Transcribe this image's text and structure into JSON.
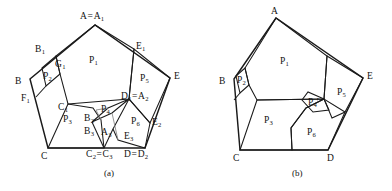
{
  "figure": {
    "panels": [
      {
        "id": "a",
        "caption": "(a)",
        "caption_pos": [
          104,
          168
        ],
        "outer_pentagon": [
          [
            95,
            25
          ],
          [
            30,
            79
          ],
          [
            48,
            148
          ],
          [
            145,
            148
          ],
          [
            170,
            78
          ]
        ],
        "paths": [
          {
            "name": "outer-pentagon-a",
            "kind": "thick",
            "closed": true,
            "pts": [
              [
                95,
                25
              ],
              [
                30,
                79
              ],
              [
                48,
                148
              ],
              [
                145,
                148
              ],
              [
                170,
                78
              ]
            ]
          },
          {
            "name": "region-p1-a",
            "kind": "edge",
            "closed": true,
            "pts": [
              [
                95,
                25
              ],
              [
                56,
                56
              ],
              [
                60,
                74
              ],
              [
                68,
                104
              ],
              [
                129,
                99
              ],
              [
                134,
                49
              ]
            ]
          },
          {
            "name": "region-p2-a",
            "kind": "edge",
            "closed": true,
            "pts": [
              [
                42,
                68
              ],
              [
                56,
                56
              ],
              [
                60,
                74
              ],
              [
                46,
                86
              ]
            ]
          },
          {
            "name": "region-p3-a",
            "kind": "edge",
            "closed": true,
            "pts": [
              [
                68,
                104
              ],
              [
                48,
                148
              ],
              [
                104,
                148
              ],
              [
                101,
                120
              ],
              [
                93,
                108
              ]
            ]
          },
          {
            "name": "region-p5-a",
            "kind": "edge",
            "closed": true,
            "pts": [
              [
                134,
                49
              ],
              [
                129,
                99
              ],
              [
                150,
                123
              ],
              [
                170,
                78
              ]
            ]
          },
          {
            "name": "region-p6-a",
            "kind": "edge",
            "closed": true,
            "pts": [
              [
                129,
                99
              ],
              [
                113,
                129
              ],
              [
                118,
                140
              ],
              [
                145,
                148
              ],
              [
                150,
                123
              ]
            ]
          },
          {
            "name": "region-p4-a",
            "kind": "edge",
            "closed": true,
            "pts": [
              [
                129,
                99
              ],
              [
                108,
                108
              ],
              [
                92,
                122
              ],
              [
                112,
                113
              ]
            ]
          },
          {
            "name": "fold-b2b3-a",
            "kind": "faint",
            "closed": false,
            "pts": [
              [
                101,
                120
              ],
              [
                96,
                110
              ],
              [
                108,
                108
              ]
            ]
          },
          {
            "name": "fold-a3-a",
            "kind": "edge",
            "closed": false,
            "pts": [
              [
                92,
                122
              ],
              [
                104,
                148
              ]
            ]
          },
          {
            "name": "fold-e3-a",
            "kind": "faint",
            "closed": false,
            "pts": [
              [
                112,
                113
              ],
              [
                118,
                140
              ]
            ]
          },
          {
            "name": "fold-a3e3-a",
            "kind": "edge",
            "closed": false,
            "pts": [
              [
                104,
                148
              ],
              [
                113,
                129
              ]
            ]
          },
          {
            "name": "seg-f1-a",
            "kind": "edge",
            "closed": false,
            "pts": [
              [
                46,
                86
              ],
              [
                36,
                97
              ]
            ]
          }
        ],
        "labels": [
          {
            "name": "vertex-label-A-A1",
            "base": "A",
            "sub": "",
            "eq": "A",
            "eqsub": "1",
            "x": 80,
            "y": 12
          },
          {
            "name": "vertex-label-B1",
            "base": "B",
            "sub": "1",
            "x": 35,
            "y": 45
          },
          {
            "name": "vertex-label-E1",
            "base": "E",
            "sub": "1",
            "x": 136,
            "y": 42
          },
          {
            "name": "vertex-label-E",
            "base": "E",
            "sub": "",
            "x": 174,
            "y": 72
          },
          {
            "name": "vertex-label-B",
            "base": "B",
            "sub": "",
            "x": 15,
            "y": 77
          },
          {
            "name": "vertex-label-G1",
            "base": "G",
            "sub": "1",
            "x": 55,
            "y": 60
          },
          {
            "name": "vertex-label-F1",
            "base": "F",
            "sub": "1",
            "x": 21,
            "y": 94
          },
          {
            "name": "vertex-label-C1",
            "base": "C",
            "sub": "1",
            "x": 58,
            "y": 103
          },
          {
            "name": "vertex-label-D1-A2",
            "base": "D",
            "sub": "1",
            "eq": "A",
            "eqsub": "2",
            "x": 121,
            "y": 92
          },
          {
            "name": "vertex-label-C",
            "base": "C",
            "sub": "",
            "x": 41,
            "y": 152
          },
          {
            "name": "vertex-label-C2-C3",
            "base": "C",
            "sub": "2",
            "eq": "C",
            "eqsub": "3",
            "x": 86,
            "y": 150
          },
          {
            "name": "vertex-label-D-D2",
            "base": "D",
            "sub": "",
            "eq": "D",
            "eqsub": "2",
            "x": 124,
            "y": 150
          },
          {
            "name": "vertex-label-B2",
            "base": "B",
            "sub": "2",
            "x": 84,
            "y": 114
          },
          {
            "name": "vertex-label-B3",
            "base": "B",
            "sub": "3",
            "x": 84,
            "y": 127
          },
          {
            "name": "vertex-label-A3",
            "base": "A",
            "sub": "3",
            "x": 101,
            "y": 128
          },
          {
            "name": "vertex-label-E2",
            "base": "E",
            "sub": "2",
            "x": 152,
            "y": 118
          },
          {
            "name": "vertex-label-E3",
            "base": "E",
            "sub": "3",
            "x": 124,
            "y": 132
          },
          {
            "name": "region-label-P1",
            "base": "P",
            "sub": "1",
            "x": 89,
            "y": 56,
            "region": true
          },
          {
            "name": "region-label-P2",
            "base": "P",
            "sub": "2",
            "x": 43,
            "y": 72,
            "region": true
          },
          {
            "name": "region-label-P3",
            "base": "P",
            "sub": "3",
            "x": 63,
            "y": 115,
            "region": true
          },
          {
            "name": "region-label-P4",
            "base": "P",
            "sub": "4",
            "x": 101,
            "y": 105,
            "region": true
          },
          {
            "name": "region-label-P5",
            "base": "P",
            "sub": "5",
            "x": 140,
            "y": 74,
            "region": true
          },
          {
            "name": "region-label-P6",
            "base": "P",
            "sub": "6",
            "x": 131,
            "y": 117,
            "region": true
          }
        ]
      },
      {
        "id": "b",
        "caption": "(b)",
        "caption_pos": [
          292,
          168
        ],
        "outer_pentagon": [
          [
            276,
            18
          ],
          [
            234,
            79
          ],
          [
            240,
            150
          ],
          [
            328,
            150
          ],
          [
            363,
            78
          ]
        ],
        "paths": [
          {
            "name": "outer-pentagon-b",
            "kind": "thick",
            "closed": true,
            "pts": [
              [
                276,
                18
              ],
              [
                234,
                79
              ],
              [
                240,
                150
              ],
              [
                328,
                150
              ],
              [
                363,
                78
              ]
            ]
          },
          {
            "name": "region-p1-b",
            "kind": "edge",
            "closed": true,
            "pts": [
              [
                276,
                18
              ],
              [
                245,
                68
              ],
              [
                249,
                85
              ],
              [
                257,
                100
              ],
              [
                324,
                99
              ],
              [
                327,
                56
              ]
            ]
          },
          {
            "name": "region-p2-b",
            "kind": "edge",
            "closed": true,
            "pts": [
              [
                236,
                76
              ],
              [
                245,
                68
              ],
              [
                249,
                85
              ],
              [
                240,
                93
              ]
            ]
          },
          {
            "name": "region-p3-b",
            "kind": "edge",
            "closed": true,
            "pts": [
              [
                257,
                100
              ],
              [
                240,
                150
              ],
              [
                292,
                150
              ],
              [
                291,
                128
              ],
              [
                306,
                108
              ],
              [
                324,
                99
              ]
            ]
          },
          {
            "name": "region-p5-b",
            "kind": "edge",
            "closed": true,
            "pts": [
              [
                327,
                56
              ],
              [
                324,
                99
              ],
              [
                332,
                118
              ],
              [
                345,
                112
              ],
              [
                363,
                78
              ]
            ]
          },
          {
            "name": "region-p6-b",
            "kind": "edge",
            "closed": true,
            "pts": [
              [
                324,
                99
              ],
              [
                306,
                108
              ],
              [
                291,
                128
              ],
              [
                292,
                150
              ],
              [
                328,
                150
              ],
              [
                345,
                112
              ]
            ]
          },
          {
            "name": "region-p4prime-b",
            "kind": "edge",
            "closed": true,
            "pts": [
              [
                324,
                99
              ],
              [
                308,
                92
              ],
              [
                302,
                100
              ],
              [
                313,
                112
              ],
              [
                329,
                110
              ]
            ]
          },
          {
            "name": "seg-f1-b",
            "kind": "edge",
            "closed": false,
            "pts": [
              [
                240,
                93
              ],
              [
                234,
                100
              ]
            ]
          }
        ],
        "labels": [
          {
            "name": "vertex-label-A-b",
            "base": "A",
            "sub": "",
            "x": 271,
            "y": 7
          },
          {
            "name": "vertex-label-B-b",
            "base": "B",
            "sub": "",
            "x": 219,
            "y": 77
          },
          {
            "name": "vertex-label-C-b",
            "base": "C",
            "sub": "",
            "x": 233,
            "y": 154
          },
          {
            "name": "vertex-label-D-b",
            "base": "D",
            "sub": "",
            "x": 327,
            "y": 154
          },
          {
            "name": "vertex-label-E-b",
            "base": "E",
            "sub": "",
            "x": 367,
            "y": 72
          },
          {
            "name": "region-label-P1-b",
            "base": "P",
            "sub": "1",
            "x": 280,
            "y": 57,
            "region": true
          },
          {
            "name": "region-label-P2-b",
            "base": "P",
            "sub": "2",
            "x": 237,
            "y": 76,
            "region": true
          },
          {
            "name": "region-label-P3-b",
            "base": "P",
            "sub": "3",
            "x": 264,
            "y": 116,
            "region": true
          },
          {
            "name": "region-label-P4prime-b",
            "base": "P",
            "sub": "4",
            "prime": true,
            "x": 308,
            "y": 98,
            "region": true
          },
          {
            "name": "region-label-P5-b",
            "base": "P",
            "sub": "5",
            "x": 337,
            "y": 88,
            "region": true
          },
          {
            "name": "region-label-P6-b",
            "base": "P",
            "sub": "6",
            "x": 307,
            "y": 128,
            "region": true
          }
        ]
      }
    ]
  }
}
